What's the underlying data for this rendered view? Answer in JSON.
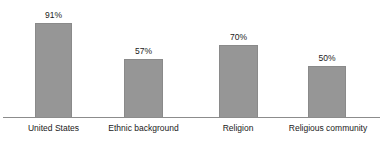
{
  "chart_data": {
    "type": "bar",
    "title": "",
    "subtitle": "",
    "xlabel": "",
    "ylabel": "",
    "ylim": [
      0,
      100
    ],
    "grid": false,
    "legend": false,
    "legend_position": "none",
    "axis_visible": {
      "x": true,
      "y": false
    },
    "value_label_suffix": "%",
    "categories": [
      "United States",
      "Ethnic background",
      "Religion",
      "Religious community"
    ],
    "values": [
      91,
      57,
      70,
      50
    ],
    "value_labels": [
      "91%",
      "57%",
      "70%",
      "50%"
    ],
    "colors": {
      "bar_fill": "#969696",
      "bar_border": "#8a8a8a",
      "axis_line": "#8c8c8c",
      "text": "#1a1a1a",
      "background": "#ffffff"
    }
  }
}
